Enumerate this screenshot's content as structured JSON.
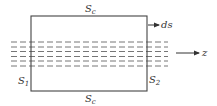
{
  "diagram": {
    "type": "control-surface",
    "labels": {
      "top_surface": {
        "main": "S",
        "sub": "c"
      },
      "bottom_surface": {
        "main": "S",
        "sub": "c"
      },
      "left_surface": {
        "main": "S",
        "sub": "1"
      },
      "right_surface": {
        "main": "S",
        "sub": "2"
      },
      "normal_vector": "ds",
      "axis": "z"
    },
    "dashed_lines_count": 6,
    "colors": {
      "stroke": "#444444",
      "dash": "#666666",
      "background": "#ffffff"
    }
  }
}
